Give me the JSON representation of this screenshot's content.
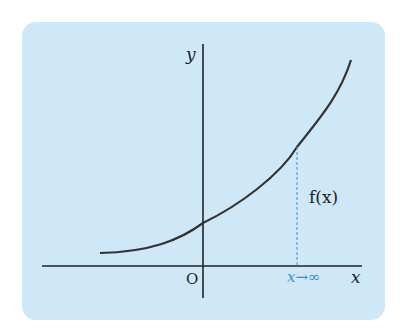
{
  "diagram": {
    "y_axis_label": "y",
    "x_axis_label": "x",
    "origin_label": "O",
    "function_label": "f(x)",
    "limit_label_var": "x",
    "limit_label_arrow": "→∞",
    "colors": {
      "background": "#cfe8f7",
      "curve": "#333333",
      "axes": "#222222",
      "dashed": "#3a8fd0",
      "limit_label": "#3a8fd0"
    }
  }
}
